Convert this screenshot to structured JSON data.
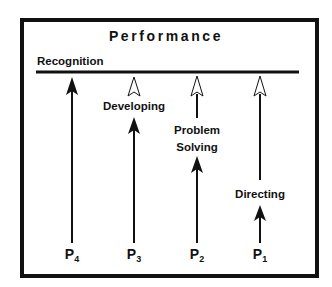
{
  "title": "Performance",
  "recognition_label": "Recognition",
  "stages": [
    {
      "id": "P4",
      "letter": "P",
      "sub": "4",
      "x": 72,
      "label": null
    },
    {
      "id": "P3",
      "letter": "P",
      "sub": "3",
      "x": 134,
      "label": "Developing"
    },
    {
      "id": "P2",
      "letter": "P",
      "sub": "2",
      "x": 197,
      "label_line1": "Problem",
      "label_line2": "Solving"
    },
    {
      "id": "P1",
      "letter": "P",
      "sub": "1",
      "x": 260,
      "label": "Directing"
    }
  ],
  "colors": {
    "line": "#111111",
    "background": "#ffffff"
  }
}
